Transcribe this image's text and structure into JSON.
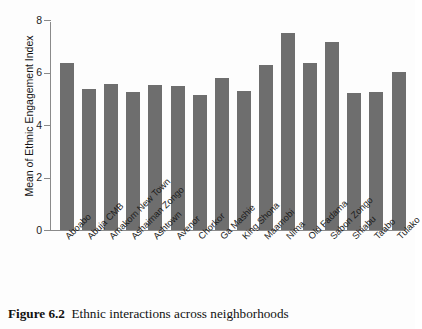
{
  "figure": {
    "caption_label": "Figure 6.2",
    "caption_text": "Ethnic interactions across neighborhoods"
  },
  "colors": {
    "bar": "#6e6e6e",
    "axis": "#8a8a8a",
    "text": "#1b1b1b",
    "background": "#fdfdfd"
  },
  "chart_data": {
    "type": "bar",
    "title": "",
    "xlabel": "",
    "ylabel": "Mean of Ethnic Engagement Index",
    "ylim": [
      0,
      8
    ],
    "yticks": [
      0,
      2,
      4,
      6,
      8
    ],
    "ytick_labels": [
      "0",
      "2",
      "4",
      "6",
      "8"
    ],
    "grid": false,
    "legend": null,
    "categories": [
      "Aboabo",
      "Abuja CMB",
      "Amakom New Town",
      "Ashaiman Zongo",
      "Ashtown",
      "Avenor",
      "Chorkor",
      "Ga Mashie",
      "King Shona",
      "Maamobi",
      "Nima",
      "Old Fadama",
      "Sabon Zongo",
      "Shiabu",
      "Taabo",
      "Tulako"
    ],
    "values": [
      6.35,
      5.38,
      5.58,
      5.25,
      5.52,
      5.5,
      5.15,
      5.8,
      5.3,
      6.3,
      7.51,
      6.38,
      7.17,
      5.22,
      5.25,
      6.02
    ]
  }
}
